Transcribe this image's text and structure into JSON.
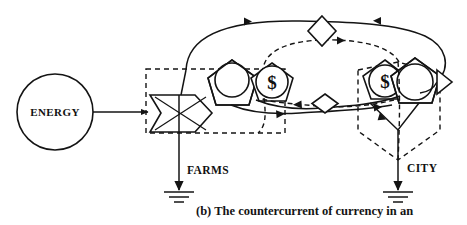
{
  "figure": {
    "title_caption": "(b)  The countercurrent of currency in an",
    "caption_label": "(b)",
    "caption_body": "The countercurrent of currency in an",
    "background_color": "#ffffff",
    "ink_color": "#141414"
  },
  "nodes": {
    "energy_source": {
      "label": "ENERGY",
      "shape": "circle",
      "cx": 55,
      "cy": 112,
      "r": 38
    },
    "interaction": {
      "label": "",
      "shape": "interaction-x",
      "name": "interaction-symbol"
    },
    "farms_producer": {
      "label": "",
      "shape": "producer-pentagon"
    },
    "farms_money_store": {
      "label": "$",
      "shape": "producer-pentagon-with-dollar"
    },
    "city_money_store": {
      "label": "$",
      "shape": "producer-pentagon-with-dollar"
    },
    "city_consumer": {
      "label": "",
      "shape": "producer-pentagon"
    },
    "top_transaction": {
      "label": "",
      "shape": "diamond-transaction"
    },
    "mid_transaction": {
      "label": "",
      "shape": "diamond-transaction"
    }
  },
  "labels": {
    "energy": "ENERGY",
    "farms": "FARMS",
    "city": "CITY",
    "dollar_left": "$",
    "dollar_right": "$"
  },
  "boundaries": {
    "farms_boundary": {
      "style": "dashed",
      "shape": "rectangle"
    },
    "city_boundary": {
      "style": "dashed",
      "shape": "hexagon"
    }
  },
  "flows": {
    "energy_to_interaction": {
      "style": "solid",
      "direction": "right"
    },
    "goods_city_to_farms_top": {
      "style": "solid",
      "direction": "left"
    },
    "money_farms_to_city_top": {
      "style": "dashed",
      "direction": "right"
    },
    "goods_farms_to_city_mid": {
      "style": "solid",
      "direction": "right"
    },
    "money_city_to_farms_mid": {
      "style": "dashed",
      "direction": "left"
    },
    "farms_heat_sink": {
      "style": "solid",
      "direction": "down"
    },
    "city_heat_sink": {
      "style": "solid",
      "direction": "down"
    }
  },
  "symbols": {
    "heat_sink_farms": "heat-sink",
    "heat_sink_city": "heat-sink"
  }
}
